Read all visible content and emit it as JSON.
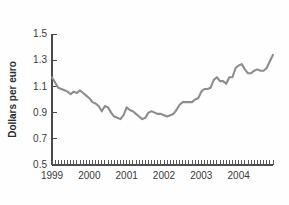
{
  "chart_data": {
    "type": "line",
    "title": "",
    "subtitle": "",
    "xlabel": "",
    "ylabel": "Dollars per euro",
    "ylim": [
      0.5,
      1.5
    ],
    "xlim": [
      1999.0,
      2004.92
    ],
    "grid": false,
    "legend": null,
    "line_color": "#8d8d8d",
    "axis_color": "#4a4a4a",
    "y_ticks": [
      0.5,
      0.7,
      0.9,
      1.1,
      1.3,
      1.5
    ],
    "y_tick_labels": [
      "0.5",
      "0.7",
      "0.9",
      "1.1",
      "1.3",
      "1.5"
    ],
    "x_ticks": [
      1999,
      2000,
      2001,
      2002,
      2003,
      2004
    ],
    "x_tick_labels": [
      "1999",
      "2000",
      "2001",
      "2002",
      "2003",
      "2004"
    ],
    "x_minor_tick_count": 71,
    "series": [
      {
        "name": "Dollars per euro",
        "x": [
          1999.0,
          1999.083,
          1999.167,
          1999.25,
          1999.333,
          1999.417,
          1999.5,
          1999.583,
          1999.667,
          1999.75,
          1999.833,
          1999.917,
          2000.0,
          2000.083,
          2000.167,
          2000.25,
          2000.333,
          2000.417,
          2000.5,
          2000.583,
          2000.667,
          2000.75,
          2000.833,
          2000.917,
          2001.0,
          2001.083,
          2001.167,
          2001.25,
          2001.333,
          2001.417,
          2001.5,
          2001.583,
          2001.667,
          2001.75,
          2001.833,
          2001.917,
          2002.0,
          2002.083,
          2002.167,
          2002.25,
          2002.333,
          2002.417,
          2002.5,
          2002.583,
          2002.667,
          2002.75,
          2002.833,
          2002.917,
          2003.0,
          2003.083,
          2003.167,
          2003.25,
          2003.333,
          2003.417,
          2003.5,
          2003.583,
          2003.667,
          2003.75,
          2003.833,
          2003.917,
          2004.0,
          2004.083,
          2004.167,
          2004.25,
          2004.333,
          2004.417,
          2004.5,
          2004.583,
          2004.667,
          2004.75,
          2004.833,
          2004.917
        ],
        "y": [
          1.17,
          1.13,
          1.09,
          1.08,
          1.07,
          1.06,
          1.04,
          1.06,
          1.05,
          1.07,
          1.05,
          1.03,
          1.01,
          0.98,
          0.97,
          0.95,
          0.91,
          0.95,
          0.94,
          0.9,
          0.87,
          0.86,
          0.85,
          0.88,
          0.94,
          0.92,
          0.91,
          0.89,
          0.87,
          0.85,
          0.86,
          0.9,
          0.91,
          0.9,
          0.89,
          0.89,
          0.88,
          0.87,
          0.88,
          0.89,
          0.92,
          0.96,
          0.98,
          0.98,
          0.98,
          0.98,
          1.0,
          1.01,
          1.06,
          1.08,
          1.08,
          1.09,
          1.15,
          1.17,
          1.14,
          1.14,
          1.12,
          1.17,
          1.17,
          1.24,
          1.26,
          1.27,
          1.23,
          1.2,
          1.2,
          1.22,
          1.23,
          1.22,
          1.22,
          1.24,
          1.29,
          1.34
        ]
      }
    ]
  },
  "axis_labels": {
    "y_title": "Dollars per euro"
  }
}
